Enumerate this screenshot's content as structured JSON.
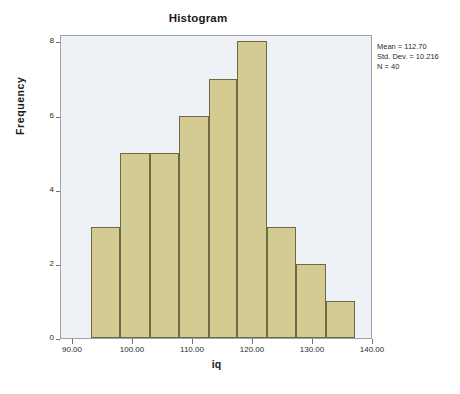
{
  "chart_data": {
    "type": "bar",
    "title": "Histogram",
    "xlabel": "iq",
    "ylabel": "Frequency",
    "categories": [
      "93.0-97.9",
      "97.9-102.8",
      "102.8-107.7",
      "107.7-112.6",
      "112.6-117.4",
      "117.4-122.3",
      "122.3-127.2",
      "127.2-132.1",
      "132.1-137.0"
    ],
    "bin_starts": [
      93.0,
      97.9,
      102.8,
      107.7,
      112.6,
      117.4,
      122.3,
      127.2,
      132.1
    ],
    "bin_ends": [
      97.9,
      102.8,
      107.7,
      112.6,
      117.4,
      122.3,
      127.2,
      132.1,
      137.0
    ],
    "values": [
      3,
      5,
      5,
      6,
      7,
      8,
      3,
      2,
      1
    ],
    "xlim": [
      88.0,
      140.0
    ],
    "ylim": [
      0,
      8.2
    ],
    "x_ticks": [
      90.0,
      100.0,
      110.0,
      120.0,
      130.0,
      140.0
    ],
    "x_tick_labels": [
      "90.00",
      "100.00",
      "110.00",
      "120.00",
      "130.00",
      "140.00"
    ],
    "y_ticks": [
      0,
      2,
      4,
      6,
      8
    ],
    "y_tick_labels": [
      "0",
      "2",
      "4",
      "6",
      "8"
    ],
    "grid": false,
    "legend": "none",
    "bar_fill_color": "#d3cb92",
    "bar_border_color": "#6e6a44",
    "plot_background_color": "#eef2f6",
    "annotations": {
      "mean_line": "Mean = 112.70",
      "stddev_line": "Std. Dev. = 10.216",
      "n_line": "N = 40",
      "position": "top-right-outside"
    }
  },
  "stats": {
    "mean": "Mean = 112.70",
    "std_dev": "Std. Dev. = 10.216",
    "n": "N = 40"
  }
}
